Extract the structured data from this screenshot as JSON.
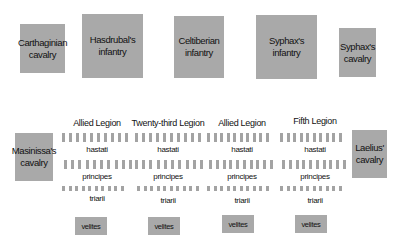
{
  "enemy_line": [
    {
      "id": "carthaginian-cavalry",
      "label_line1": "Carthaginian",
      "label_line2": "cavalry"
    },
    {
      "id": "hasdrubals-infantry",
      "label_line1": "Hasdrubal's",
      "label_line2": "infantry"
    },
    {
      "id": "celtiberian-infantry",
      "label_line1": "Celtiberian",
      "label_line2": "infantry"
    },
    {
      "id": "syphaxs-infantry",
      "label_line1": "Syphax's",
      "label_line2": "infantry"
    },
    {
      "id": "syphaxs-cavalry",
      "label_line1": "Syphax's",
      "label_line2": "cavalry"
    }
  ],
  "roman_flanks": {
    "left": {
      "label_line1": "Masinissa's",
      "label_line2": "cavalry"
    },
    "right": {
      "label_line1": "Laelius'",
      "label_line2": "cavalry"
    }
  },
  "legions": [
    {
      "title": "Allied Legion",
      "hastati": "hastati",
      "principes": "principes",
      "triarii": "triarii",
      "velites": "velites",
      "bars_per_line": 10
    },
    {
      "title": "Twenty-third Legion",
      "hastati": "hastati",
      "principes": "principes",
      "triarii": "triarii",
      "velites": "velites",
      "bars_per_line": 10
    },
    {
      "title": "Allied Legion",
      "hastati": "hastati",
      "principes": "principes",
      "triarii": "triarii",
      "velites": "velites",
      "bars_per_line": 10
    },
    {
      "title": "Fifth Legion",
      "hastati": "hastati",
      "principes": "principes",
      "triarii": "triarii",
      "velites": "velites",
      "bars_per_line": 10
    }
  ],
  "colors": {
    "unit_box": "#a9a9a9",
    "maniple_bar": "#a3a3a3",
    "background": "#ffffff"
  }
}
